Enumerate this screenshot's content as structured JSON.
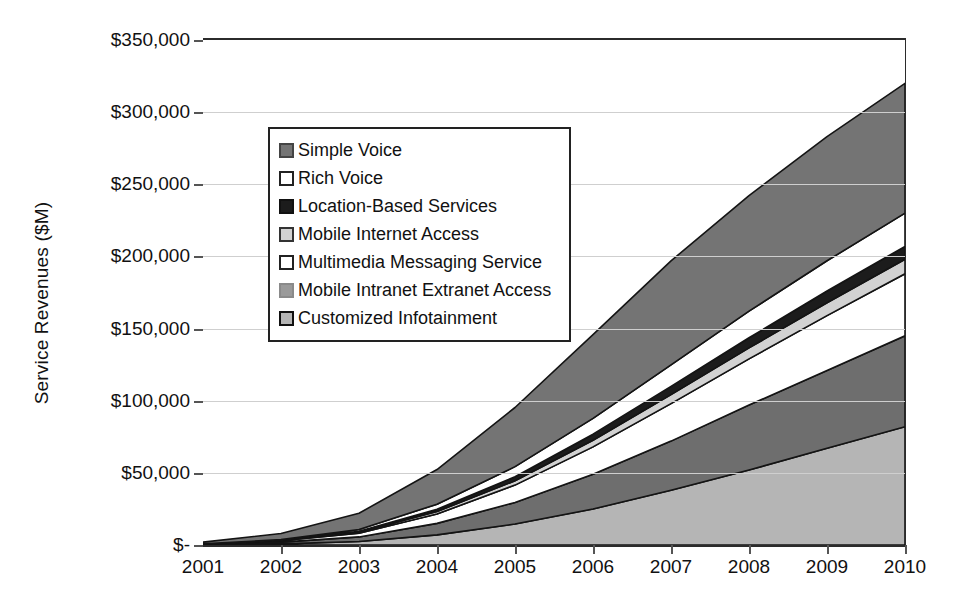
{
  "chart_data": {
    "type": "area",
    "title": "",
    "subtitle": "",
    "xlabel": "",
    "ylabel": "Service Revenues ($M)",
    "stacked": true,
    "grid": true,
    "legend_position": "inside-upper-left",
    "x": [
      2001,
      2002,
      2003,
      2004,
      2005,
      2006,
      2007,
      2008,
      2009,
      2010
    ],
    "categories": [
      "2001",
      "2002",
      "2003",
      "2004",
      "2005",
      "2006",
      "2007",
      "2008",
      "2009",
      "2010"
    ],
    "xlim": [
      2001,
      2010
    ],
    "ylim": [
      0,
      350000
    ],
    "y_ticks": [
      0,
      50000,
      100000,
      150000,
      200000,
      250000,
      300000,
      350000
    ],
    "y_tick_labels": [
      "$-",
      "$50,000",
      "$100,000",
      "$150,000",
      "$200,000",
      "$250,000",
      "$300,000",
      "$350,000"
    ],
    "series": [
      {
        "name": "Customized Infotainment",
        "color": "#b5b5b5",
        "stack_order": 1,
        "values": [
          200,
          800,
          2400,
          7000,
          14500,
          25000,
          38000,
          52000,
          67000,
          82000
        ]
      },
      {
        "name": "Mobile Intranet Extranet Access",
        "color": "#6e6e6e",
        "stack_order": 2,
        "values": [
          300,
          1200,
          3200,
          8000,
          15000,
          24000,
          34000,
          45000,
          54000,
          63000
        ]
      },
      {
        "name": "Multimedia Messaging Service",
        "color": "#ffffff",
        "stack_order": 3,
        "values": [
          200,
          900,
          2600,
          6500,
          12000,
          19000,
          26000,
          32000,
          38000,
          43000
        ]
      },
      {
        "name": "Mobile Internet Access",
        "color": "#d2d2d2",
        "stack_order": 4,
        "values": [
          60,
          220,
          700,
          1700,
          3000,
          4600,
          6200,
          7600,
          8900,
          10000
        ]
      },
      {
        "name": "Location-Based Services",
        "color": "#1c1c1c",
        "stack_order": 5,
        "values": [
          50,
          200,
          600,
          1500,
          2800,
          4200,
          5700,
          7000,
          8100,
          9000
        ]
      },
      {
        "name": "Rich Voice",
        "color": "#ffffff",
        "stack_order": 6,
        "values": [
          100,
          400,
          1300,
          3600,
          7000,
          11000,
          15000,
          18500,
          21000,
          23000
        ]
      },
      {
        "name": "Simple Voice",
        "color": "#747474",
        "stack_order": 7,
        "values": [
          1100,
          4300,
          11200,
          24000,
          41000,
          58000,
          72000,
          80000,
          86000,
          90000
        ]
      }
    ],
    "cumulative_2010": [
      82000,
      145000,
      188000,
      198000,
      207000,
      230000,
      320000
    ]
  },
  "legend": {
    "items": [
      {
        "label": "Simple Voice",
        "swatch": "#747474",
        "border": "#444444"
      },
      {
        "label": "Rich Voice",
        "swatch": "#ffffff",
        "border": "#222222"
      },
      {
        "label": "Location-Based Services",
        "swatch": "#1c1c1c",
        "border": "#111111"
      },
      {
        "label": "Mobile Internet Access",
        "swatch": "#d2d2d2",
        "border": "#333333"
      },
      {
        "label": "Multimedia Messaging Service",
        "swatch": "#ffffff",
        "border": "#222222"
      },
      {
        "label": "Mobile Intranet Extranet Access",
        "swatch": "#9a9a9a",
        "border": "#8a8a8a"
      },
      {
        "label": "Customized Infotainment",
        "swatch": "#b5b5b5",
        "border": "#111111"
      }
    ]
  },
  "axes": {
    "y_title": "Service Revenues ($M)",
    "y_tick_labels": [
      "$350,000",
      "$300,000",
      "$250,000",
      "$200,000",
      "$150,000",
      "$100,000",
      "$50,000",
      "$-"
    ],
    "x_tick_labels": [
      "2001",
      "2002",
      "2003",
      "2004",
      "2005",
      "2006",
      "2007",
      "2008",
      "2009",
      "2010"
    ]
  },
  "colors": {
    "axis": "#2b2b2b",
    "grid": "#cfcfcf",
    "text": "#111111",
    "plot_background": "#ffffff"
  }
}
